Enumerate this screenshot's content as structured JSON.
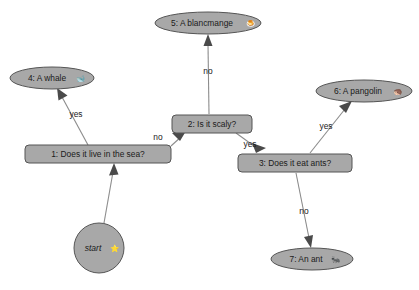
{
  "diagram": {
    "type": "decision-tree-flowchart",
    "background_color": "#ffffff",
    "node_fill_color": "#a8a8a8",
    "node_stroke_color": "#555555",
    "edge_color": "#8c8c8c",
    "arrow_color": "#4a4a4a",
    "text_color": "#1a1a1a"
  },
  "nodes": {
    "start": {
      "label": "start",
      "emoji": "⭐",
      "shape": "circle",
      "cx": 99,
      "cy": 248,
      "r": 25
    },
    "n1": {
      "label": "1: Does it live in the sea?",
      "shape": "rounded-rect",
      "cx": 98,
      "cy": 154,
      "w": 146,
      "h": 18
    },
    "n2": {
      "label": "2: Is it scaly?",
      "shape": "rounded-rect",
      "cx": 212,
      "cy": 124,
      "w": 80,
      "h": 18
    },
    "n3": {
      "label": "3: Does it eat ants?",
      "shape": "rounded-rect",
      "cx": 295,
      "cy": 163,
      "w": 114,
      "h": 18
    },
    "n4": {
      "label": "4: A whale",
      "emoji": "🐋",
      "shape": "ellipse",
      "cx": 52,
      "cy": 78,
      "rx": 42,
      "ry": 11
    },
    "n5": {
      "label": "5: A blancmange",
      "emoji": "🍮",
      "shape": "ellipse",
      "cx": 208,
      "cy": 23,
      "rx": 53,
      "ry": 11
    },
    "n6": {
      "label": "6: A pangolin",
      "emoji": "🦔",
      "shape": "ellipse",
      "cx": 364,
      "cy": 91,
      "rx": 48,
      "ry": 11
    },
    "n7": {
      "label": "7: An ant",
      "emoji": "🐜",
      "shape": "ellipse",
      "cx": 312,
      "cy": 259,
      "rx": 41,
      "ry": 11
    }
  },
  "edges": [
    {
      "id": "start-to-1",
      "from": "start",
      "to": "n1",
      "label": ""
    },
    {
      "id": "1-to-4",
      "from": "n1",
      "to": "n4",
      "label": "yes",
      "label_x": 76,
      "label_y": 115
    },
    {
      "id": "1-to-2",
      "from": "n1",
      "to": "n2",
      "label": "no",
      "label_x": 158,
      "label_y": 138
    },
    {
      "id": "2-to-5",
      "from": "n2",
      "to": "n5",
      "label": "no",
      "label_x": 208,
      "label_y": 72
    },
    {
      "id": "2-to-3",
      "from": "n2",
      "to": "n3",
      "label": "yes",
      "label_x": 250,
      "label_y": 145
    },
    {
      "id": "3-to-6",
      "from": "n3",
      "to": "n6",
      "label": "yes",
      "label_x": 326,
      "label_y": 127
    },
    {
      "id": "3-to-7",
      "from": "n3",
      "to": "n7",
      "label": "no",
      "label_x": 304,
      "label_y": 212
    }
  ]
}
